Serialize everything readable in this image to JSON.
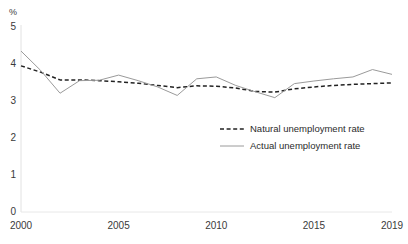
{
  "chart_data": {
    "type": "line",
    "title": "",
    "xlabel": "",
    "ylabel": "%",
    "unit_label": "%",
    "x": [
      2000,
      2001,
      2002,
      2003,
      2004,
      2005,
      2006,
      2007,
      2008,
      2009,
      2010,
      2011,
      2012,
      2013,
      2014,
      2015,
      2016,
      2017,
      2018,
      2019
    ],
    "xlim": [
      2000,
      2019
    ],
    "ylim": [
      0,
      5
    ],
    "ytick_labels": [
      "0",
      "1",
      "2",
      "3",
      "4",
      "5"
    ],
    "ytick_values": [
      0,
      1,
      2,
      3,
      4,
      5
    ],
    "xtick_labels": [
      "2000",
      "2005",
      "2010",
      "2015",
      "2019"
    ],
    "xtick_values": [
      2000,
      2005,
      2010,
      2015,
      2019
    ],
    "grid": false,
    "legend_position": "center-right",
    "series": [
      {
        "name": "Natural unemployment rate",
        "style": "dashed",
        "color": "#222222",
        "values": [
          3.95,
          3.78,
          3.57,
          3.57,
          3.55,
          3.52,
          3.48,
          3.42,
          3.36,
          3.41,
          3.4,
          3.35,
          3.26,
          3.24,
          3.33,
          3.38,
          3.42,
          3.45,
          3.47,
          3.49
        ]
      },
      {
        "name": "Actual unemployment rate",
        "style": "solid",
        "color": "#9a9a9a",
        "values": [
          4.35,
          3.83,
          3.21,
          3.55,
          3.56,
          3.7,
          3.55,
          3.38,
          3.15,
          3.6,
          3.65,
          3.42,
          3.25,
          3.09,
          3.47,
          3.54,
          3.6,
          3.65,
          3.85,
          3.72
        ]
      }
    ]
  },
  "legend": {
    "items": [
      {
        "label": "Natural unemployment rate"
      },
      {
        "label": "Actual unemployment rate"
      }
    ]
  }
}
